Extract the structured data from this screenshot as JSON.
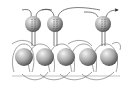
{
  "diagram": {
    "type": "molecular-chain-illustration",
    "colors": {
      "background": "#ffffff",
      "sphere_light": "#f2f2f2",
      "sphere_mid": "#a8a8a8",
      "sphere_dark": "#555555",
      "line": "#555555"
    },
    "top_spheres": [
      {
        "cx": 33,
        "cy": 24,
        "r": 8
      },
      {
        "cx": 55,
        "cy": 24,
        "r": 8
      },
      {
        "cx": 103,
        "cy": 24,
        "r": 8
      }
    ],
    "bottom_spheres": [
      {
        "cx": 24,
        "cy": 57,
        "r": 9
      },
      {
        "cx": 45,
        "cy": 57,
        "r": 9
      },
      {
        "cx": 66,
        "cy": 57,
        "r": 9
      },
      {
        "cx": 88,
        "cy": 57,
        "r": 9
      },
      {
        "cx": 109,
        "cy": 57,
        "r": 9
      }
    ]
  }
}
